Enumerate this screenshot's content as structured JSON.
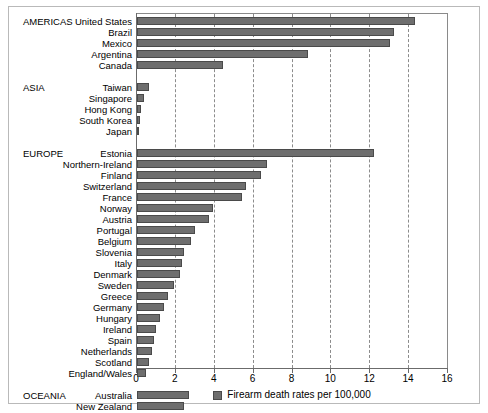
{
  "chart_data": {
    "type": "bar",
    "orientation": "horizontal",
    "title": "",
    "xlabel": "Firearm death rates per 100,000",
    "ylabel": "",
    "xlim": [
      0,
      16
    ],
    "xticks": [
      0,
      2,
      4,
      6,
      8,
      10,
      12,
      14,
      16
    ],
    "grid": true,
    "legend": [
      {
        "label": "Firearm death rates per 100,000",
        "color": "#6e6e6e"
      }
    ],
    "legend_position": "bottom-center",
    "groups": [
      {
        "name": "AMERICAS",
        "categories": [
          "United States",
          "Brazil",
          "Mexico",
          "Argentina",
          "Canada"
        ],
        "values": [
          14.3,
          13.2,
          13.0,
          8.8,
          4.4
        ]
      },
      {
        "name": "ASIA",
        "categories": [
          "Taiwan",
          "Singapore",
          "Hong Kong",
          "South Korea",
          "Japan"
        ],
        "values": [
          0.6,
          0.35,
          0.2,
          0.15,
          0.07
        ]
      },
      {
        "name": "EUROPE",
        "categories": [
          "Estonia",
          "Northern-Ireland",
          "Finland",
          "Switzerland",
          "France",
          "Norway",
          "Austria",
          "Portugal",
          "Belgium",
          "Slovenia",
          "Italy",
          "Denmark",
          "Sweden",
          "Greece",
          "Germany",
          "Hungary",
          "Ireland",
          "Spain",
          "Netherlands",
          "Scotland",
          "England/Wales"
        ],
        "values": [
          12.2,
          6.7,
          6.4,
          5.6,
          5.4,
          3.9,
          3.7,
          3.0,
          2.8,
          2.4,
          2.3,
          2.2,
          1.9,
          1.6,
          1.4,
          1.2,
          1.0,
          0.9,
          0.75,
          0.6,
          0.45
        ]
      },
      {
        "name": "OCEANIA",
        "categories": [
          "Australia",
          "New Zealand"
        ],
        "values": [
          2.7,
          2.4
        ]
      }
    ],
    "colors": {
      "bar_fill": "#6e6e6e",
      "bar_edge": "#4a4a4a",
      "gridline": "#8c8c8c",
      "axis": "#6b6b6b",
      "frame": "#b9b9b9",
      "background": "#ffffff"
    }
  }
}
